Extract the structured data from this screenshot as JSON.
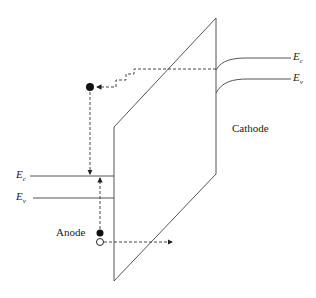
{
  "labels": {
    "cathode": "Cathode",
    "anode": "Anode",
    "cathode_ec": {
      "main": "E",
      "sub": "c"
    },
    "cathode_ev": {
      "main": "E",
      "sub": "v"
    },
    "anode_ec": {
      "main": "E",
      "sub": "c"
    },
    "anode_ev": {
      "main": "E",
      "sub": "v"
    }
  },
  "colors": {
    "line": "#444444",
    "dash": "#333333",
    "dot": "#111111"
  }
}
